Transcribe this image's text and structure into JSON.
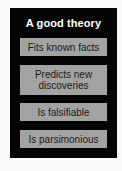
{
  "diagram": {
    "title": "A good theory",
    "criteria": [
      {
        "label": "Fits known facts"
      },
      {
        "label": "Predicts new discoveries"
      },
      {
        "label": "Is falsifiable"
      },
      {
        "label": "Is parsimonious"
      }
    ],
    "colors": {
      "panel_background": "#050505",
      "box_background": "#a3a3a3",
      "title_text": "#ffffff",
      "box_text": "#1a1a1a",
      "page_background": "#fafafa"
    }
  }
}
